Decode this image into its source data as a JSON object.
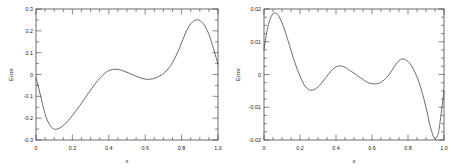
{
  "figure": {
    "background": "#ffffff",
    "axis_color": "#2b2b2b",
    "curve_color": "#3a3a3a",
    "panel_count": 2
  },
  "chart_data": [
    {
      "type": "line",
      "title": "",
      "xlabel": "x",
      "ylabel": "Error",
      "xlim": [
        0.0,
        1.0
      ],
      "ylim": [
        -0.3,
        0.3
      ],
      "grid": false,
      "legend": null,
      "xticks": [
        0.0,
        0.2,
        0.4,
        0.6,
        0.8,
        1.0
      ],
      "xticklabels": [
        "0",
        "0.2",
        "0.4",
        "0.6",
        "0.8",
        "1.0"
      ],
      "yticks": [
        -0.3,
        -0.2,
        -0.1,
        0.0,
        0.1,
        0.2,
        0.3
      ],
      "yticklabels": [
        "-0.3",
        "-0.2",
        "-0.1",
        "0",
        "0.1",
        "0.2",
        "0.3"
      ],
      "minor_ticks": true,
      "series": [
        {
          "name": "error",
          "x": [
            0.0,
            0.01,
            0.02,
            0.03,
            0.04,
            0.05,
            0.06,
            0.08,
            0.1,
            0.11,
            0.12,
            0.14,
            0.16,
            0.18,
            0.2,
            0.22,
            0.24,
            0.26,
            0.28,
            0.3,
            0.32,
            0.34,
            0.36,
            0.38,
            0.4,
            0.41,
            0.43,
            0.45,
            0.47,
            0.5,
            0.52,
            0.54,
            0.56,
            0.58,
            0.6,
            0.62,
            0.64,
            0.66,
            0.68,
            0.7,
            0.72,
            0.74,
            0.76,
            0.78,
            0.8,
            0.82,
            0.84,
            0.86,
            0.88,
            0.89,
            0.9,
            0.92,
            0.94,
            0.955,
            0.97,
            0.985,
            1.0
          ],
          "y": [
            -0.015,
            -0.045,
            -0.08,
            -0.115,
            -0.15,
            -0.18,
            -0.205,
            -0.237,
            -0.25,
            -0.251,
            -0.249,
            -0.24,
            -0.226,
            -0.208,
            -0.188,
            -0.166,
            -0.143,
            -0.119,
            -0.095,
            -0.071,
            -0.048,
            -0.027,
            -0.009,
            0.007,
            0.018,
            0.021,
            0.024,
            0.023,
            0.019,
            0.01,
            0.003,
            -0.004,
            -0.011,
            -0.017,
            -0.021,
            -0.022,
            -0.02,
            -0.015,
            -0.007,
            0.004,
            0.02,
            0.041,
            0.07,
            0.105,
            0.146,
            0.186,
            0.22,
            0.241,
            0.25,
            0.25,
            0.247,
            0.233,
            0.203,
            0.172,
            0.133,
            0.09,
            0.048
          ]
        }
      ]
    },
    {
      "type": "line",
      "title": "",
      "xlabel": "x",
      "ylabel": "Error",
      "xlim": [
        0.0,
        1.0
      ],
      "ylim": [
        -0.02,
        0.02
      ],
      "grid": false,
      "legend": null,
      "xticks": [
        0.0,
        0.2,
        0.4,
        0.6,
        0.8,
        1.0
      ],
      "xticklabels": [
        "0",
        "0.2",
        "0.4",
        "0.6",
        "0.8",
        "1.0"
      ],
      "yticks": [
        -0.02,
        -0.01,
        0.0,
        0.01,
        0.02
      ],
      "yticklabels": [
        "-0.02",
        "-0.01",
        "0",
        "0.01",
        "0.02"
      ],
      "minor_ticks": true,
      "series": [
        {
          "name": "error",
          "x": [
            0.0,
            0.01,
            0.02,
            0.03,
            0.04,
            0.05,
            0.06,
            0.07,
            0.08,
            0.1,
            0.12,
            0.14,
            0.16,
            0.18,
            0.2,
            0.215,
            0.23,
            0.245,
            0.26,
            0.28,
            0.3,
            0.32,
            0.34,
            0.36,
            0.38,
            0.4,
            0.415,
            0.43,
            0.45,
            0.47,
            0.5,
            0.53,
            0.56,
            0.58,
            0.6,
            0.62,
            0.64,
            0.66,
            0.69,
            0.71,
            0.73,
            0.75,
            0.765,
            0.78,
            0.8,
            0.82,
            0.84,
            0.86,
            0.88,
            0.9,
            0.92,
            0.935,
            0.945,
            0.955,
            0.97,
            0.985,
            1.0
          ],
          "y": [
            0.0078,
            0.0112,
            0.0142,
            0.0163,
            0.0177,
            0.0185,
            0.0188,
            0.0186,
            0.018,
            0.0158,
            0.0127,
            0.0092,
            0.0056,
            0.0023,
            -0.0005,
            -0.0023,
            -0.0037,
            -0.0045,
            -0.0048,
            -0.0046,
            -0.0038,
            -0.0026,
            -0.0012,
            0.0002,
            0.0015,
            0.0023,
            0.0026,
            0.0026,
            0.0022,
            0.0015,
            0.0004,
            -0.0008,
            -0.0019,
            -0.0025,
            -0.0028,
            -0.0029,
            -0.0026,
            -0.002,
            -0.0004,
            0.0012,
            0.0029,
            0.0042,
            0.0047,
            0.0047,
            0.004,
            0.0026,
            0.0005,
            -0.0022,
            -0.0058,
            -0.01,
            -0.015,
            -0.018,
            -0.0193,
            -0.0195,
            -0.0175,
            -0.0115,
            -0.005
          ]
        }
      ]
    }
  ]
}
